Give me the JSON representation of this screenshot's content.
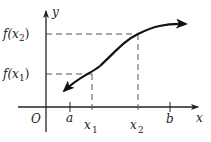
{
  "diagram": {
    "type": "function-graph",
    "axes": {
      "x_label": "x",
      "y_label": "y",
      "origin_label": "O"
    },
    "x_ticks": [
      {
        "label": "a",
        "subscript": ""
      },
      {
        "label": "x",
        "subscript": "1"
      },
      {
        "label": "x",
        "subscript": "2"
      },
      {
        "label": "b",
        "subscript": ""
      }
    ],
    "y_levels": [
      {
        "label_main": "f(x",
        "label_sub": "2",
        "label_end": ")"
      },
      {
        "label_main": "f(x",
        "label_sub": "1",
        "label_end": ")"
      }
    ],
    "colors": {
      "stroke": "#222222",
      "dash": "#555555",
      "background": "#ffffff"
    }
  }
}
